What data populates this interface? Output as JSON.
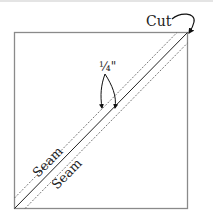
{
  "diagram": {
    "type": "half-square triangle sewing diagram",
    "labels": {
      "cut": "Cut",
      "seam_allowance": "¼\"",
      "seam_upper": "Seam",
      "seam_lower": "Seam"
    },
    "colors": {
      "square_border": "#8a8a8a",
      "cut_line": "#222222",
      "seam_line": "#555555",
      "arrow": "#111111"
    }
  }
}
